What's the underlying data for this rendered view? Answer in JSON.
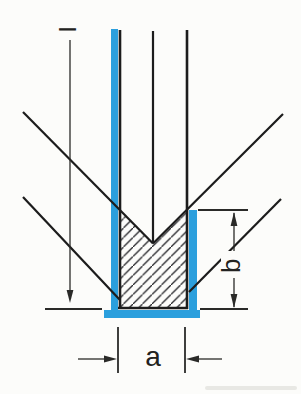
{
  "figure": {
    "kind": "technical-drawing",
    "labels": {
      "depth_label": "l",
      "residual_depth_label": "b",
      "diameter_label": "a"
    },
    "colors": {
      "highlight_blue": "#2b9fdd",
      "line_black": "#1c1c1c",
      "dimension_line": "#2a2a28",
      "paper": "#fcfcfa"
    }
  }
}
